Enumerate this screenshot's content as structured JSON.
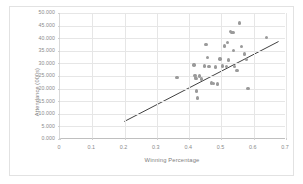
{
  "chart_data": {
    "type": "scatter",
    "title": "",
    "xlabel": "Winning Percentage",
    "ylabel": "Attendance (000s)",
    "xlim": [
      0,
      0.7
    ],
    "ylim": [
      0,
      50
    ],
    "grid": true,
    "legend": false,
    "marker_color": "#9a9a9a",
    "trendline_color": "#404040",
    "xticks": [
      "0",
      "0.1",
      "0.2",
      "0.3",
      "0.4",
      "0.5",
      "0.6",
      "0.7"
    ],
    "xtick_values": [
      0,
      0.1,
      0.2,
      0.3,
      0.4,
      0.5,
      0.6,
      0.7
    ],
    "yticks": [
      "0.000",
      "5.000",
      "10.000",
      "15.000",
      "20.000",
      "25.000",
      "30.000",
      "35.000",
      "40.000",
      "45.000",
      "50.000"
    ],
    "ytick_values": [
      0,
      5,
      10,
      15,
      20,
      25,
      30,
      35,
      40,
      45,
      50
    ],
    "points": [
      {
        "x": 0.362,
        "y": 24.5
      },
      {
        "x": 0.415,
        "y": 29.4
      },
      {
        "x": 0.418,
        "y": 25.2
      },
      {
        "x": 0.42,
        "y": 24.4
      },
      {
        "x": 0.421,
        "y": 23.9
      },
      {
        "x": 0.423,
        "y": 19.1
      },
      {
        "x": 0.425,
        "y": 16.2
      },
      {
        "x": 0.432,
        "y": 25.0
      },
      {
        "x": 0.438,
        "y": 23.8
      },
      {
        "x": 0.447,
        "y": 28.9
      },
      {
        "x": 0.452,
        "y": 37.5
      },
      {
        "x": 0.457,
        "y": 32.4
      },
      {
        "x": 0.462,
        "y": 28.8
      },
      {
        "x": 0.47,
        "y": 22.3
      },
      {
        "x": 0.476,
        "y": 22.0
      },
      {
        "x": 0.481,
        "y": 28.5
      },
      {
        "x": 0.487,
        "y": 21.9
      },
      {
        "x": 0.496,
        "y": 31.8
      },
      {
        "x": 0.503,
        "y": 28.9
      },
      {
        "x": 0.509,
        "y": 36.9
      },
      {
        "x": 0.515,
        "y": 28.7
      },
      {
        "x": 0.519,
        "y": 38.2
      },
      {
        "x": 0.522,
        "y": 31.4
      },
      {
        "x": 0.529,
        "y": 42.6
      },
      {
        "x": 0.532,
        "y": 42.3
      },
      {
        "x": 0.536,
        "y": 42.2
      },
      {
        "x": 0.538,
        "y": 35.2
      },
      {
        "x": 0.541,
        "y": 28.7
      },
      {
        "x": 0.548,
        "y": 27.3
      },
      {
        "x": 0.556,
        "y": 46.0
      },
      {
        "x": 0.562,
        "y": 36.8
      },
      {
        "x": 0.572,
        "y": 33.8
      },
      {
        "x": 0.578,
        "y": 31.5
      },
      {
        "x": 0.582,
        "y": 20.0
      },
      {
        "x": 0.64,
        "y": 40.3
      }
    ],
    "trendline": {
      "x0": 0.2,
      "y0": 6.6,
      "x1": 0.68,
      "y1": 38.6
    }
  }
}
